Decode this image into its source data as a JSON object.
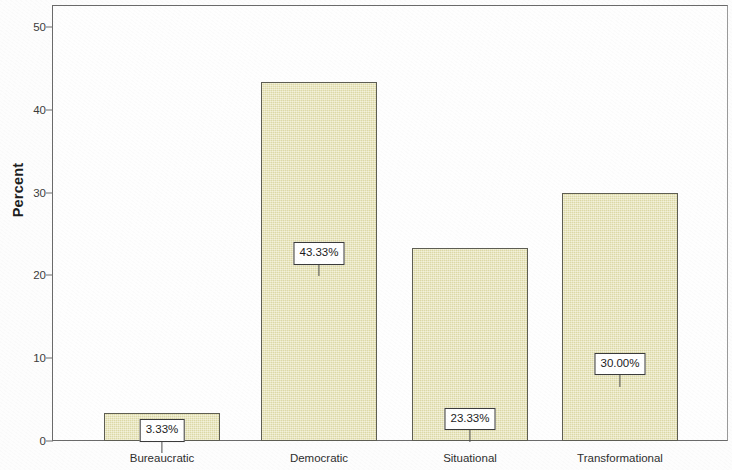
{
  "chart_data": {
    "type": "bar",
    "title": "",
    "subtitle": "",
    "xlabel": "",
    "ylabel": "Percent",
    "categories": [
      "Bureaucratic",
      "Democratic",
      "Situational",
      "Transformational"
    ],
    "values": [
      3.33,
      43.33,
      23.33,
      30.0
    ],
    "data_labels": [
      "3.33%",
      "43.33%",
      "23.33%",
      "30.00%"
    ],
    "ylim": [
      0,
      50
    ],
    "yticks": [
      0,
      10,
      20,
      30,
      40,
      50
    ],
    "ytick_labels": [
      "0",
      "10",
      "20",
      "30",
      "40",
      "50"
    ],
    "grid": false,
    "legend": false,
    "legend_position": "none",
    "bar_fill_color": "#e6e2ae",
    "bar_border_color": "#5d5d52",
    "axis_color": "#6a6a6a",
    "label_box_border_color": "#3a3a3a",
    "label_box_fill_color": "#ffffff",
    "background_color": "#fdfdfd"
  }
}
